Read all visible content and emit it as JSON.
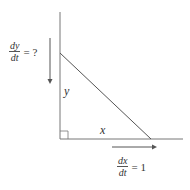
{
  "diagram": {
    "type": "related-rates-right-triangle",
    "colors": {
      "line": "#555555",
      "axis": "#777777",
      "text": "#333333",
      "background": "#ffffff"
    },
    "labels": {
      "vertical_side": "y",
      "horizontal_side": "x",
      "dy_num": "dy",
      "dy_den": "dt",
      "dy_rhs": "= ?",
      "dx_num": "dx",
      "dx_den": "dt",
      "dx_rhs": "= 1"
    },
    "arrows": [
      {
        "name": "dy-dt-arrow",
        "direction": "down"
      },
      {
        "name": "dx-dt-arrow",
        "direction": "right"
      }
    ],
    "right_angle_marker": true
  }
}
